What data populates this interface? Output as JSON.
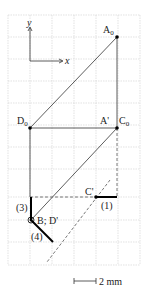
{
  "axes": {
    "x_label": "x",
    "y_label": "y"
  },
  "points": {
    "A0": {
      "label": "A",
      "sub": "0"
    },
    "D0": {
      "label": "D",
      "sub": "0"
    },
    "Aprime_C0": {
      "label_a": "A'",
      "label_c": "C",
      "sub": "0"
    },
    "Cprime": {
      "label": "C'"
    },
    "B_Dprime": {
      "label": "B; D'"
    }
  },
  "segments": {
    "s1": "(1)",
    "s3": "(3)",
    "s4": "(4)"
  },
  "scale_bar": {
    "label": "2 mm"
  }
}
